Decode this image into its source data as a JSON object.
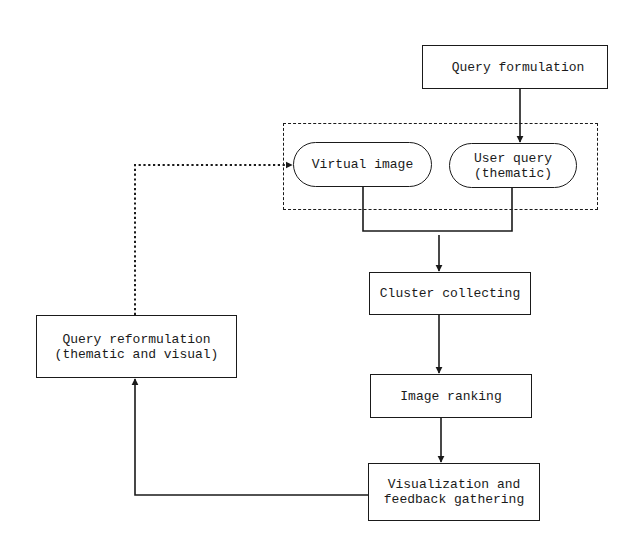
{
  "diagram": {
    "type": "flowchart",
    "nodes": {
      "query_formulation": {
        "label": "Query formulation",
        "shape": "rectangle"
      },
      "virtual_image": {
        "label": "Virtual image",
        "shape": "rounded-pill"
      },
      "user_query": {
        "label": "User query\n(thematic)",
        "shape": "rounded-pill"
      },
      "cluster_collecting": {
        "label": "Cluster collecting",
        "shape": "rectangle"
      },
      "image_ranking": {
        "label": "Image ranking",
        "shape": "rectangle"
      },
      "visualization": {
        "label": "Visualization and\nfeedback gathering",
        "shape": "rectangle"
      },
      "query_reformulation": {
        "label": "Query reformulation\n(thematic and visual)",
        "shape": "rectangle"
      }
    },
    "groups": [
      {
        "name": "query-input-group",
        "members": [
          "virtual_image",
          "user_query"
        ],
        "style": "dashed"
      }
    ],
    "edges": [
      {
        "from": "query_formulation",
        "to": "user_query",
        "style": "solid"
      },
      {
        "from": "query-input-group",
        "to": "cluster_collecting",
        "style": "solid",
        "note": "both virtual image and user query merge"
      },
      {
        "from": "cluster_collecting",
        "to": "image_ranking",
        "style": "solid"
      },
      {
        "from": "image_ranking",
        "to": "visualization",
        "style": "solid"
      },
      {
        "from": "visualization",
        "to": "query_reformulation",
        "style": "solid"
      },
      {
        "from": "query_reformulation",
        "to": "virtual_image",
        "style": "dotted"
      }
    ]
  }
}
